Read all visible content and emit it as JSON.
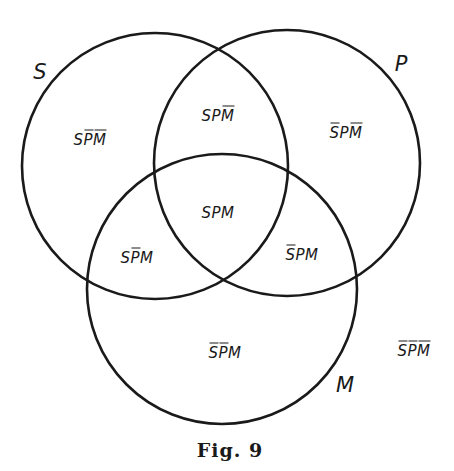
{
  "figure": {
    "caption": "Fig. 9",
    "stroke_color": "#1a1a1a",
    "background": "#ffffff"
  },
  "sets": [
    {
      "id": "S",
      "label": "S",
      "cx": 155,
      "cy": 166,
      "r": 133,
      "label_x": 40,
      "label_y": 72
    },
    {
      "id": "P",
      "label": "P",
      "cx": 287,
      "cy": 163,
      "r": 133,
      "label_x": 401,
      "label_y": 64
    },
    {
      "id": "M",
      "label": "M",
      "cx": 222,
      "cy": 289,
      "r": 135,
      "label_x": 345,
      "label_y": 385
    }
  ],
  "regions": [
    {
      "id": "s-only",
      "text": "SP̄M̄",
      "chars": [
        {
          "c": "S",
          "bar": false
        },
        {
          "c": "P",
          "bar": true
        },
        {
          "c": "M",
          "bar": true
        }
      ],
      "x": 90,
      "y": 140
    },
    {
      "id": "s-and-p",
      "text": "SPM̄",
      "chars": [
        {
          "c": "S",
          "bar": false
        },
        {
          "c": "P",
          "bar": false
        },
        {
          "c": "M",
          "bar": true
        }
      ],
      "x": 218,
      "y": 116
    },
    {
      "id": "p-only",
      "text": "S̄PM̄",
      "chars": [
        {
          "c": "S",
          "bar": true
        },
        {
          "c": "P",
          "bar": false
        },
        {
          "c": "M",
          "bar": true
        }
      ],
      "x": 346,
      "y": 133
    },
    {
      "id": "s-p-m",
      "text": "SPM",
      "chars": [
        {
          "c": "S",
          "bar": false
        },
        {
          "c": "P",
          "bar": false
        },
        {
          "c": "M",
          "bar": false
        }
      ],
      "x": 218,
      "y": 213
    },
    {
      "id": "s-and-m",
      "text": "SP̄M",
      "chars": [
        {
          "c": "S",
          "bar": false
        },
        {
          "c": "P",
          "bar": true
        },
        {
          "c": "M",
          "bar": false
        }
      ],
      "x": 137,
      "y": 258
    },
    {
      "id": "p-and-m",
      "text": "S̄PM",
      "chars": [
        {
          "c": "S",
          "bar": true
        },
        {
          "c": "P",
          "bar": false
        },
        {
          "c": "M",
          "bar": false
        }
      ],
      "x": 302,
      "y": 255
    },
    {
      "id": "m-only",
      "text": "S̄P̄M",
      "chars": [
        {
          "c": "S",
          "bar": true
        },
        {
          "c": "P",
          "bar": true
        },
        {
          "c": "M",
          "bar": false
        }
      ],
      "x": 225,
      "y": 353
    },
    {
      "id": "outside",
      "text": "S̄P̄M̄",
      "chars": [
        {
          "c": "S",
          "bar": true
        },
        {
          "c": "P",
          "bar": true
        },
        {
          "c": "M",
          "bar": true
        }
      ],
      "x": 414,
      "y": 351
    }
  ]
}
